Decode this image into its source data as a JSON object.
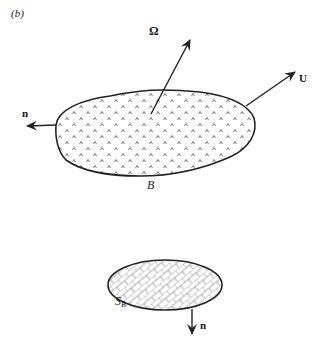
{
  "figure": {
    "panel_label": "(b)",
    "body": {
      "label": "B",
      "fill_pattern": "caret-dots",
      "outline_color": "#222222"
    },
    "vectors": {
      "angular_velocity": {
        "label": "Ω"
      },
      "velocity": {
        "label": "U"
      },
      "normal_body": {
        "label": "n"
      },
      "normal_surface": {
        "label": "n"
      }
    },
    "surface": {
      "label_main": "S",
      "label_sub": "B",
      "fill_pattern": "brick-crosshatch",
      "outline_color": "#222222"
    },
    "colors": {
      "ink": "#222222",
      "pattern": "#666666",
      "background": "#ffffff"
    }
  }
}
